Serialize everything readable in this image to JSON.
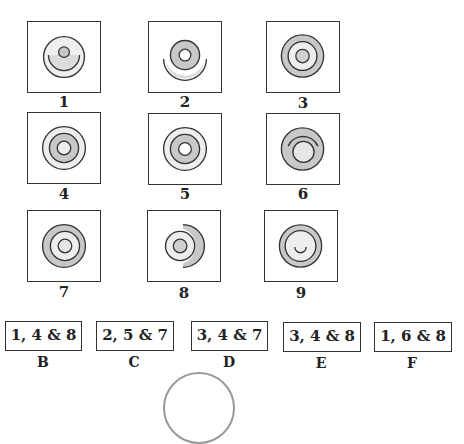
{
  "figures": [
    {
      "id": "1",
      "label": "1",
      "description": "light ring with small gray center dot, lower arc inside"
    },
    {
      "id": "2",
      "label": "2",
      "description": "gray ring with white center, outer lower arc"
    },
    {
      "id": "3",
      "label": "3",
      "description": "gray outer ring, light middle ring, gray center dot"
    },
    {
      "id": "4",
      "label": "4",
      "description": "light outer ring, gray middle ring, light center"
    },
    {
      "id": "5",
      "label": "5",
      "description": "light outer ring, gray middle ring, white center"
    },
    {
      "id": "6",
      "label": "6",
      "description": "gray disk with light inner circle and upper arc"
    },
    {
      "id": "7",
      "label": "7",
      "description": "gray outer ring, light middle ring, light center"
    },
    {
      "id": "8",
      "label": "8",
      "description": "light circle with gray center, gray right crescent"
    },
    {
      "id": "9",
      "label": "9",
      "description": "gray outer ring, light inner circle with small smile arc"
    }
  ],
  "options": [
    {
      "letter": "B",
      "text": "1, 4 & 8"
    },
    {
      "letter": "C",
      "text": "2, 5 & 7"
    },
    {
      "letter": "D",
      "text": "3, 4 & 7"
    },
    {
      "letter": "E",
      "text": "3, 4 & 8"
    },
    {
      "letter": "F",
      "text": "1, 6 & 8"
    }
  ],
  "colors": {
    "gray": "#c8c8c8",
    "light": "#eeeeee",
    "stroke": "#333333"
  }
}
